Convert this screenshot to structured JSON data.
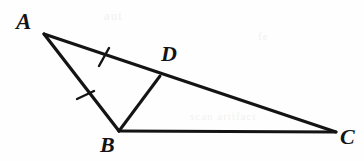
{
  "figure": {
    "kind": "geometry-diagram",
    "width": 364,
    "height": 161,
    "background_color": "#fefefe",
    "stroke_color": "#141414",
    "label_color": "#141414"
  },
  "points": [
    {
      "name": "A",
      "label": "A",
      "x": 44,
      "y": 34,
      "label_x": 16,
      "label_y": 10
    },
    {
      "name": "B",
      "label": "B",
      "x": 119,
      "y": 131,
      "label_x": 100,
      "label_y": 134
    },
    {
      "name": "C",
      "label": "C",
      "x": 336,
      "y": 132,
      "label_x": 340,
      "label_y": 126
    },
    {
      "name": "D",
      "label": "D",
      "x": 160,
      "y": 76,
      "label_x": 161,
      "label_y": 43
    }
  ],
  "segments": [
    {
      "name": "side-AC",
      "from": "A",
      "to": "C",
      "x1": 44,
      "y1": 34,
      "x2": 336,
      "y2": 132,
      "stroke_width": 3.0
    },
    {
      "name": "side-AB",
      "from": "A",
      "to": "B",
      "x1": 44,
      "y1": 34,
      "x2": 119,
      "y2": 131,
      "stroke_width": 3.2
    },
    {
      "name": "side-BC",
      "from": "B",
      "to": "C",
      "x1": 119,
      "y1": 131,
      "x2": 336,
      "y2": 132,
      "stroke_width": 3.0
    },
    {
      "name": "cevian-BD",
      "from": "B",
      "to": "D",
      "x1": 119,
      "y1": 131,
      "x2": 160,
      "y2": 76,
      "stroke_width": 3.0
    }
  ],
  "tick_marks": [
    {
      "name": "tick-on-AD",
      "on_segment": "AD",
      "count": 1,
      "cx": 104,
      "cy": 57,
      "x1": 99,
      "y1": 66,
      "x2": 109,
      "y2": 48,
      "stroke_width": 2.4
    },
    {
      "name": "tick-on-AB",
      "on_segment": "AB",
      "count": 1,
      "cx": 85,
      "cy": 95,
      "x1": 77,
      "y1": 99,
      "x2": 94,
      "y2": 91,
      "stroke_width": 2.4
    }
  ],
  "ghost_marks": {
    "top": "aut",
    "right": "fe",
    "mid": "scan artifact"
  }
}
